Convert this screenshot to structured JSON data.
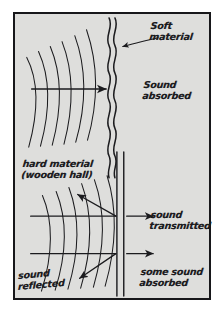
{
  "diagram": {
    "background_color": "#dededc",
    "ink_color": "#1b1b1e",
    "border_color": "#17171a",
    "page_color": "#ffffff",
    "panels": [
      {
        "id": "soft-material-panel",
        "name": "Soft material absorbs sound",
        "barrier_type": "wavy-double-line",
        "wavefront_count": 6,
        "incident_ray_count": 1,
        "reflected_ray_count": 0,
        "transmitted_ray_count": 0
      },
      {
        "id": "hard-material-panel",
        "name": "Hard material reflects and transmits sound",
        "barrier_type": "straight-double-line",
        "wavefront_count": 6,
        "incident_ray_count": 2,
        "reflected_ray_count": 2,
        "transmitted_ray_count": 2
      }
    ]
  },
  "labels": {
    "soft_material": "Soft\nmaterial",
    "sound_absorbed": "Sound\nabsorbed",
    "hard_material": "hard material\n(wooden hall)",
    "sound_transmitted": "sound\ntransmitted",
    "sound_reflected": "sound\nreflected",
    "some_sound_absorbed": "some sound\nabsorbed"
  }
}
